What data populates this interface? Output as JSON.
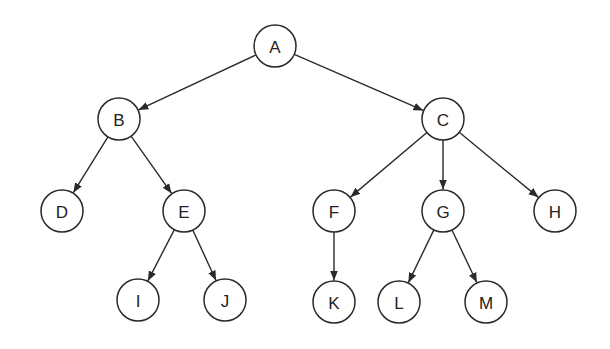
{
  "diagram": {
    "type": "tree",
    "directed": true,
    "colors": {
      "stroke": "#2a2a2a",
      "fill": "#ffffff",
      "text": "#222222"
    },
    "radius": 21,
    "nodes": [
      {
        "id": "A",
        "label": "A",
        "x": 275,
        "y": 46
      },
      {
        "id": "B",
        "label": "B",
        "x": 119,
        "y": 119
      },
      {
        "id": "C",
        "label": "C",
        "x": 443,
        "y": 119
      },
      {
        "id": "D",
        "label": "D",
        "x": 62,
        "y": 211
      },
      {
        "id": "E",
        "label": "E",
        "x": 184,
        "y": 211
      },
      {
        "id": "F",
        "label": "F",
        "x": 334,
        "y": 211
      },
      {
        "id": "G",
        "label": "G",
        "x": 443,
        "y": 211
      },
      {
        "id": "H",
        "label": "H",
        "x": 555,
        "y": 211
      },
      {
        "id": "I",
        "label": "I",
        "x": 138,
        "y": 300
      },
      {
        "id": "J",
        "label": "J",
        "x": 225,
        "y": 300
      },
      {
        "id": "K",
        "label": "K",
        "x": 334,
        "y": 302
      },
      {
        "id": "L",
        "label": "L",
        "x": 399,
        "y": 302
      },
      {
        "id": "M",
        "label": "M",
        "x": 486,
        "y": 302
      }
    ],
    "edges": [
      {
        "from": "A",
        "to": "B"
      },
      {
        "from": "A",
        "to": "C"
      },
      {
        "from": "B",
        "to": "D"
      },
      {
        "from": "B",
        "to": "E"
      },
      {
        "from": "C",
        "to": "F"
      },
      {
        "from": "C",
        "to": "G"
      },
      {
        "from": "C",
        "to": "H"
      },
      {
        "from": "E",
        "to": "I"
      },
      {
        "from": "E",
        "to": "J"
      },
      {
        "from": "F",
        "to": "K"
      },
      {
        "from": "G",
        "to": "L"
      },
      {
        "from": "G",
        "to": "M"
      }
    ]
  }
}
